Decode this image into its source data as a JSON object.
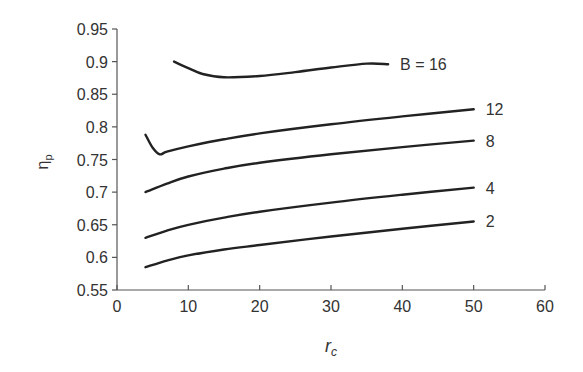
{
  "chart_data": {
    "type": "line",
    "title": "",
    "xlabel": "r_c",
    "ylabel": "η_p",
    "xlim": [
      0,
      60
    ],
    "ylim": [
      0.55,
      0.95
    ],
    "xticks": [
      0,
      10,
      20,
      30,
      40,
      50,
      60
    ],
    "yticks": [
      0.55,
      0.6,
      0.65,
      0.7,
      0.75,
      0.8,
      0.85,
      0.9,
      0.95
    ],
    "ytick_labels": [
      "0.55",
      "0.6",
      "0.65",
      "0.7",
      "0.75",
      "0.8",
      "0.85",
      "0.9",
      "0.95"
    ],
    "grid": false,
    "legend": "inline labels at right end of curves",
    "series": [
      {
        "name": "B = 16",
        "label": "B = 16",
        "x": [
          8,
          10,
          12,
          15,
          20,
          25,
          30,
          35,
          38
        ],
        "y": [
          0.9,
          0.89,
          0.881,
          0.876,
          0.878,
          0.884,
          0.891,
          0.897,
          0.896
        ]
      },
      {
        "name": "12",
        "label": "12",
        "x": [
          4,
          5,
          6,
          7,
          10,
          15,
          20,
          30,
          40,
          50
        ],
        "y": [
          0.788,
          0.768,
          0.758,
          0.762,
          0.77,
          0.781,
          0.79,
          0.804,
          0.816,
          0.827
        ]
      },
      {
        "name": "8",
        "label": "8",
        "x": [
          4,
          7,
          10,
          15,
          20,
          30,
          40,
          50
        ],
        "y": [
          0.7,
          0.713,
          0.724,
          0.736,
          0.745,
          0.758,
          0.769,
          0.779
        ]
      },
      {
        "name": "4",
        "label": "4",
        "x": [
          4,
          7,
          10,
          15,
          20,
          30,
          40,
          50
        ],
        "y": [
          0.63,
          0.641,
          0.65,
          0.661,
          0.67,
          0.684,
          0.696,
          0.707
        ]
      },
      {
        "name": "2",
        "label": "2",
        "x": [
          4,
          7,
          10,
          15,
          20,
          30,
          40,
          50
        ],
        "y": [
          0.585,
          0.595,
          0.603,
          0.612,
          0.619,
          0.632,
          0.644,
          0.655
        ]
      }
    ]
  },
  "axes": {
    "xlabel_main": "r",
    "xlabel_sub": "c",
    "ylabel_main": "η",
    "ylabel_sub": "p"
  }
}
